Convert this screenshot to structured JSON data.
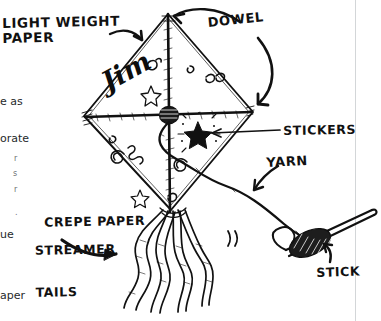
{
  "page": {
    "background": "#ffffff",
    "ink": "#111111",
    "rule_color": "#d3d6d8"
  },
  "labels": {
    "light_weight_paper": "LIGHT WEIGHT\nPAPER",
    "dowel": "DOWEL",
    "stickers": "STICKERS",
    "yarn": "YARN",
    "stick": "STICK",
    "crepe_line1": "CREPE PAPER",
    "crepe_line2": "STREAMER",
    "crepe_line3": "TAILS"
  },
  "kite": {
    "name_on_sail": "Jim",
    "decorations": [
      "star-doodle",
      "spiral-doodle",
      "squiggle-doodle",
      "sparkle-star-sticker",
      "teardrop-doodle"
    ],
    "tail_count": 4
  },
  "body_text_fragments": [
    {
      "text": "e as",
      "x": 0,
      "y": 96
    },
    {
      "text": "orate",
      "x": 0,
      "y": 133
    },
    {
      "text": "ue",
      "x": 0,
      "y": 229
    },
    {
      "text": "aper",
      "x": 0,
      "y": 290
    }
  ],
  "tiny_fragments": [
    {
      "text": "r",
      "x": 14,
      "y": 155
    },
    {
      "text": "s",
      "x": 13,
      "y": 170
    },
    {
      "text": "r",
      "x": 14,
      "y": 186
    },
    {
      "text": ".",
      "x": 15,
      "y": 209
    }
  ],
  "icons": {
    "arrow_to_paper": "curved-arrow-icon",
    "arrow_to_dowel_top": "curved-arrow-icon",
    "arrow_to_dowel_side": "curved-arrow-icon",
    "arrow_to_tails": "arrow-icon",
    "arrow_to_yarn": "arrow-icon",
    "arrow_to_stick": "arrow-icon",
    "leader_stickers": "leader-line-icon"
  }
}
